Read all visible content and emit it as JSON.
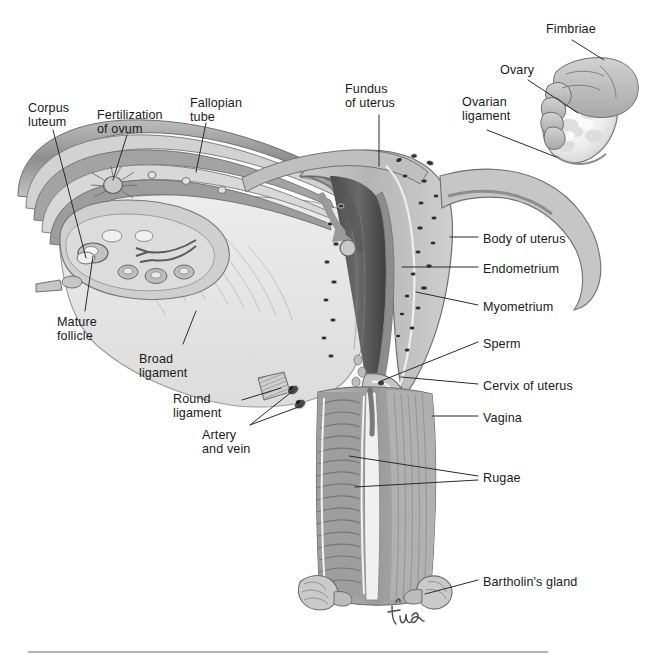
{
  "figure": {
    "kind": "anatomical-illustration",
    "signature": "tina",
    "palette": {
      "background": "#ffffff",
      "label_text": "#1a1a1a",
      "leader_line": "#2b2b2b",
      "broad_ligament": "#e6e6e6",
      "myometrium": "#b9b9b9",
      "endometrium": "#8c8c8c",
      "uterine_cavity": "#5a5a5a",
      "vagina_wall": "#a9a9a9",
      "rugae": "#8f8f8f",
      "ovary_right": "#f2f2f2",
      "fimbriae": "#bdbdbd",
      "tube_band_dark": "#7a7a7a",
      "outline": "#4a4a4a",
      "rule": "#9a9a9a"
    }
  },
  "labels": [
    {
      "id": "fimbriae",
      "text": "Fimbriae",
      "x": 546,
      "y": 22,
      "align": "left"
    },
    {
      "id": "ovary",
      "text": "Ovary",
      "x": 500,
      "y": 63,
      "align": "left"
    },
    {
      "id": "ovarian-ligament",
      "text": "Ovarian\nligament",
      "x": 462,
      "y": 95,
      "align": "left"
    },
    {
      "id": "fundus-of-uterus",
      "text": "Fundus\nof uterus",
      "x": 345,
      "y": 82,
      "align": "left"
    },
    {
      "id": "fallopian-tube",
      "text": "Fallopian\ntube",
      "x": 190,
      "y": 96,
      "align": "left"
    },
    {
      "id": "fertilization-of-ovum",
      "text": "Fertilization\nof ovum",
      "x": 97,
      "y": 108,
      "align": "left"
    },
    {
      "id": "corpus-luteum",
      "text": "Corpus\nluteum",
      "x": 28,
      "y": 101,
      "align": "left"
    },
    {
      "id": "mature-follicle",
      "text": "Mature\nfollicle",
      "x": 57,
      "y": 315,
      "align": "left"
    },
    {
      "id": "broad-ligament",
      "text": "Broad\nligament",
      "x": 139,
      "y": 352,
      "align": "left"
    },
    {
      "id": "round-ligament",
      "text": "Round\nligament",
      "x": 173,
      "y": 392,
      "align": "left"
    },
    {
      "id": "artery-and-vein",
      "text": "Artery\nand vein",
      "x": 202,
      "y": 428,
      "align": "left"
    },
    {
      "id": "body-of-uterus",
      "text": "Body of uterus",
      "x": 483,
      "y": 232,
      "align": "left"
    },
    {
      "id": "endometrium",
      "text": "Endometrium",
      "x": 483,
      "y": 262,
      "align": "left"
    },
    {
      "id": "myometrium",
      "text": "Myometrium",
      "x": 483,
      "y": 300,
      "align": "left"
    },
    {
      "id": "sperm",
      "text": "Sperm",
      "x": 483,
      "y": 337,
      "align": "left"
    },
    {
      "id": "cervix-of-uterus",
      "text": "Cervix of uterus",
      "x": 483,
      "y": 379,
      "align": "left"
    },
    {
      "id": "vagina",
      "text": "Vagina",
      "x": 483,
      "y": 411,
      "align": "left"
    },
    {
      "id": "rugae",
      "text": "Rugae",
      "x": 483,
      "y": 471,
      "align": "left"
    },
    {
      "id": "bartholins-gland",
      "text": "Bartholin's gland",
      "x": 483,
      "y": 575,
      "align": "left"
    }
  ],
  "leaders": [
    {
      "id": "fimbriae",
      "points": "572,40 604,60"
    },
    {
      "id": "ovary",
      "points": "528,80 578,113"
    },
    {
      "id": "ovarian-ligament",
      "points": "487,130 556,157"
    },
    {
      "id": "fundus-of-uterus",
      "points": "379,115 379,166"
    },
    {
      "id": "fallopian-tube",
      "points": "206,123 196,172"
    },
    {
      "id": "fertilization",
      "points": "127,135 113,180"
    },
    {
      "id": "corpus-luteum",
      "points": "53,130 86,258"
    },
    {
      "id": "mature-follicle",
      "points": "85,311 93,253"
    },
    {
      "id": "broad-ligament",
      "points": "183,344 196,311"
    },
    {
      "id": "round-ligament",
      "points": "242,400 281,388"
    },
    {
      "id": "artery-vein-a",
      "points": "250,425 296,395"
    },
    {
      "id": "artery-vein-b",
      "points": "250,425 300,408"
    },
    {
      "id": "body-of-uterus",
      "points": "450,237 478,237"
    },
    {
      "id": "endometrium",
      "points": "402,267 478,267"
    },
    {
      "id": "myometrium",
      "points": "416,292 478,305"
    },
    {
      "id": "sperm",
      "points": "381,381 478,342"
    },
    {
      "id": "cervix-of-uterus",
      "points": "401,377 478,384"
    },
    {
      "id": "vagina",
      "points": "432,416 478,416"
    },
    {
      "id": "rugae-a",
      "points": "349,456 478,476"
    },
    {
      "id": "rugae-b",
      "points": "355,487 478,480"
    },
    {
      "id": "bartholins-gland",
      "points": "425,594 478,580"
    }
  ],
  "structures": [
    {
      "id": "left-ovary-section",
      "note": "Coronal cut ovary showing primordial follicles, mature follicle and corpus luteum"
    },
    {
      "id": "left-fallopian-tube",
      "note": "Layered bands depicting sequential stages of ovum transport"
    },
    {
      "id": "uterine-cavity",
      "note": "Dark triangular cavity with arrow showing ovum descending"
    },
    {
      "id": "right-ovary",
      "note": "Whole ovary with fimbriae draped over it"
    },
    {
      "id": "vaginal-canal",
      "note": "Ridged rugae along anterior and posterior walls"
    }
  ],
  "footer_rule": {
    "x1": 28,
    "x2": 548,
    "y": 652
  }
}
